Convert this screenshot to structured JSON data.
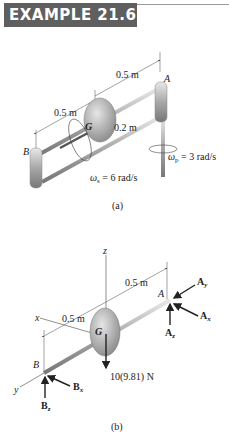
{
  "header": {
    "title": "EXAMPLE 21.6"
  },
  "figure_a": {
    "caption": "(a)",
    "dim_top": "0.5 m",
    "dim_left": "0.5 m",
    "radius": "0.2 m",
    "point_A": "A",
    "point_B": "B",
    "point_G": "G",
    "omega_s": "ω",
    "omega_s_sub": "s",
    "omega_s_val": " = 6 rad/s",
    "omega_p": "ω",
    "omega_p_sub": "p",
    "omega_p_val": " = 3 rad/s"
  },
  "figure_b": {
    "caption": "(b)",
    "axis_z": "z",
    "axis_x": "x",
    "axis_y": "y",
    "dim_right": "0.5 m",
    "dim_left": "0.5 m",
    "point_A": "A",
    "point_B": "B",
    "point_G": "G",
    "weight": "10(9.81) N",
    "Ay": "A",
    "Ay_sub": "y",
    "Ax": "A",
    "Ax_sub": "x",
    "Az": "A",
    "Az_sub": "z",
    "Bx": "B",
    "Bx_sub": "x",
    "Bz": "B",
    "Bz_sub": "z"
  }
}
